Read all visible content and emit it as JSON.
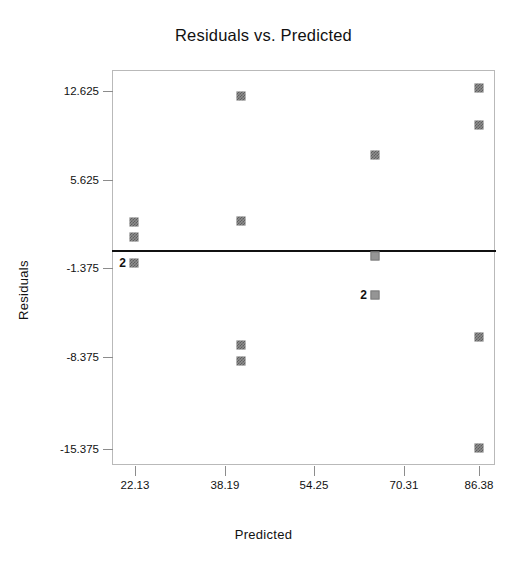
{
  "chart_data": {
    "type": "scatter",
    "title": "Residuals vs. Predicted",
    "xlabel": "Predicted",
    "ylabel": "Residuals",
    "grid": false,
    "legend": "none",
    "xlim": [
      14.1,
      94.4
    ],
    "ylim": [
      -18.5,
      15.6
    ],
    "x_ticks": [
      22.13,
      38.19,
      54.25,
      70.31,
      86.38
    ],
    "x_tick_labels": [
      "22.13",
      "38.19",
      "54.25",
      "70.31",
      "86.38"
    ],
    "y_ticks": [
      12.625,
      5.625,
      -1.375,
      -8.375,
      -15.375
    ],
    "y_tick_labels": [
      "12.625",
      "5.625",
      "-1.375",
      "-8.375",
      "-15.375"
    ],
    "reference_line": {
      "y": 0,
      "style": "solid",
      "color": "#111111"
    },
    "points": [
      {
        "x": 22.13,
        "y": 1.6,
        "count": 1,
        "label": ""
      },
      {
        "x": 22.13,
        "y": 0.4,
        "count": 1,
        "label": ""
      },
      {
        "x": 22.13,
        "y": -1.6,
        "count": 2,
        "label": "2"
      },
      {
        "x": 41.5,
        "y": 12.2,
        "count": 1,
        "label": ""
      },
      {
        "x": 41.5,
        "y": 1.7,
        "count": 1,
        "label": ""
      },
      {
        "x": 41.5,
        "y": -7.2,
        "count": 1,
        "label": ""
      },
      {
        "x": 41.5,
        "y": -8.5,
        "count": 1,
        "label": ""
      },
      {
        "x": 67.6,
        "y": 7.2,
        "count": 1,
        "label": ""
      },
      {
        "x": 67.6,
        "y": -0.8,
        "count": 1,
        "label": ""
      },
      {
        "x": 67.6,
        "y": -3.9,
        "count": 2,
        "label": "2"
      },
      {
        "x": 86.38,
        "y": 12.8,
        "count": 1,
        "label": ""
      },
      {
        "x": 86.38,
        "y": 9.9,
        "count": 1,
        "label": ""
      },
      {
        "x": 86.38,
        "y": -6.6,
        "count": 1,
        "label": ""
      },
      {
        "x": 86.38,
        "y": -15.3,
        "count": 1,
        "label": ""
      }
    ],
    "colors": {
      "marker": "#8e8e8e",
      "marker_edge": "#5f5f5f",
      "frame": "#b9b9b9",
      "reference_line": "#111111",
      "text": "#111111",
      "background": "#ffffff"
    }
  },
  "pixel_layout": {
    "plot_left": 112,
    "plot_top": 70,
    "plot_width": 383,
    "plot_height": 395,
    "zero_line_y": 250,
    "y_ticks_px": [
      91,
      180,
      268,
      357,
      449
    ],
    "x_ticks_px": [
      135,
      225,
      314,
      404,
      479
    ],
    "points_px": [
      {
        "cx": 134,
        "cy": 222,
        "label": ""
      },
      {
        "cx": 134,
        "cy": 237,
        "label": ""
      },
      {
        "cx": 134,
        "cy": 263,
        "label": "2"
      },
      {
        "cx": 241,
        "cy": 96,
        "label": ""
      },
      {
        "cx": 241,
        "cy": 221,
        "label": ""
      },
      {
        "cx": 241,
        "cy": 345,
        "label": ""
      },
      {
        "cx": 241,
        "cy": 361,
        "label": ""
      },
      {
        "cx": 375,
        "cy": 155,
        "label": ""
      },
      {
        "cx": 375,
        "cy": 256,
        "label": "",
        "style": "solid"
      },
      {
        "cx": 375,
        "cy": 295,
        "label": "2",
        "style": "solid"
      },
      {
        "cx": 479,
        "cy": 88,
        "label": ""
      },
      {
        "cx": 479,
        "cy": 125,
        "label": ""
      },
      {
        "cx": 479,
        "cy": 337,
        "label": ""
      },
      {
        "cx": 479,
        "cy": 448,
        "label": ""
      }
    ]
  }
}
